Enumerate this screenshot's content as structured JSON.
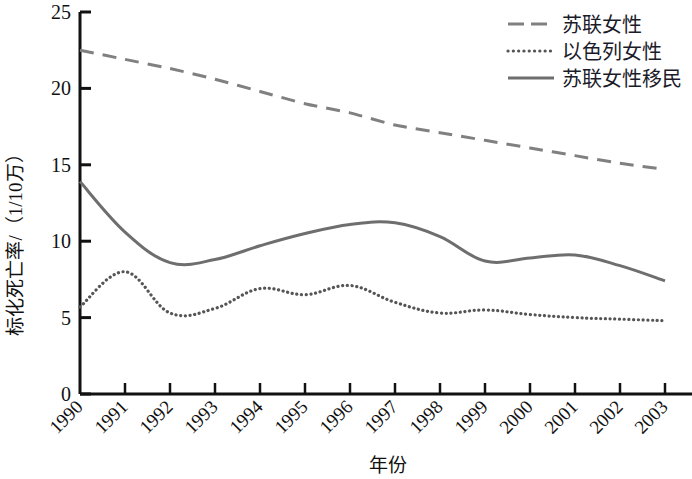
{
  "chart_data": {
    "type": "line",
    "title": "",
    "xlabel": "年份",
    "ylabel": "标化死亡率/（1/10万）",
    "x": [
      1990,
      1991,
      1992,
      1993,
      1994,
      1995,
      1996,
      1997,
      1998,
      1999,
      2000,
      2001,
      2002,
      2003
    ],
    "categories": [
      "1990",
      "1991",
      "1992",
      "1993",
      "1994",
      "1995",
      "1996",
      "1997",
      "1998",
      "1999",
      "2000",
      "2001",
      "2002",
      "2003"
    ],
    "xlim": [
      1990,
      2003.6
    ],
    "ylim": [
      0,
      25
    ],
    "yticks": [
      0,
      5,
      10,
      15,
      20,
      25
    ],
    "ytick_labels": [
      "0",
      "5",
      "10",
      "15",
      "20",
      "25"
    ],
    "grid": false,
    "legend_position": "top-right",
    "series": [
      {
        "name": "苏联女性",
        "style": "dashed",
        "color": "#808080",
        "values": [
          22.5,
          21.9,
          21.3,
          20.6,
          19.8,
          19.0,
          18.4,
          17.6,
          17.1,
          16.6,
          16.1,
          15.6,
          15.1,
          14.7
        ]
      },
      {
        "name": "以色列女性",
        "style": "dotted",
        "color": "#555555",
        "values": [
          5.7,
          8.0,
          5.3,
          5.6,
          6.9,
          6.5,
          7.1,
          6.0,
          5.3,
          5.5,
          5.2,
          5.0,
          4.9,
          4.8
        ]
      },
      {
        "name": "苏联女性移民",
        "style": "solid",
        "color": "#6e6e6e",
        "values": [
          13.9,
          10.6,
          8.6,
          8.8,
          9.7,
          10.5,
          11.1,
          11.2,
          10.3,
          8.7,
          8.9,
          9.1,
          8.4,
          7.4
        ]
      }
    ]
  },
  "axis": {
    "y_title": "标化死亡率/（1/10万）",
    "x_title": "年份",
    "y_tick_labels": [
      "25",
      "20",
      "15",
      "10",
      "5",
      "0"
    ],
    "x_tick_labels": [
      "1990",
      "1991",
      "1992",
      "1993",
      "1994",
      "1995",
      "1996",
      "1997",
      "1998",
      "1999",
      "2000",
      "2001",
      "2002",
      "2003"
    ]
  },
  "legend": {
    "items": [
      {
        "label": "苏联女性",
        "style": "dashed"
      },
      {
        "label": "以色列女性",
        "style": "dotted"
      },
      {
        "label": "苏联女性移民",
        "style": "solid"
      }
    ]
  },
  "colors": {
    "axis": "#111111",
    "dashed_series": "#808080",
    "dotted_series": "#555555",
    "solid_series": "#6e6e6e",
    "background": "#ffffff"
  }
}
